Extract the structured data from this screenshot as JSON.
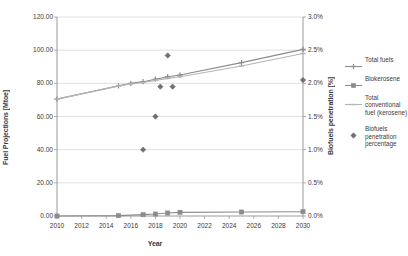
{
  "chart_data": {
    "type": "line",
    "title": "",
    "xlabel": "Year",
    "ylabel": "Fuel Projections [Mtoe]",
    "y2label": "Biofuels penetration [%]",
    "xlim": [
      2010,
      2030
    ],
    "ylim": [
      0,
      120
    ],
    "y2lim": [
      0,
      3
    ],
    "grid": true,
    "legend_position": "right",
    "xticks": [
      "2010",
      "2012",
      "2014",
      "2016",
      "2018",
      "2020",
      "2022",
      "2024",
      "2026",
      "2028",
      "2030"
    ],
    "yticks": [
      "0.00",
      "20.00",
      "40.00",
      "60.00",
      "80.00",
      "100.00",
      "120.00"
    ],
    "y2ticks": [
      "0.0%",
      "0.5%",
      "1.0%",
      "1.5%",
      "2.0%",
      "2.5%",
      "3.0%"
    ],
    "series": [
      {
        "name": "Total fuels",
        "axis": "left",
        "color": "#8c8c8c",
        "marker": "cross",
        "x": [
          2010,
          2015,
          2016,
          2017,
          2018,
          2019,
          2020,
          2025,
          2030
        ],
        "values": [
          70.5,
          78.5,
          80.0,
          81.0,
          82.5,
          84.0,
          85.0,
          92.5,
          100.5
        ]
      },
      {
        "name": "Total conventional fuel (kerosene)",
        "axis": "left",
        "color": "#b4b4b4",
        "marker": "dash",
        "x": [
          2010,
          2015,
          2016,
          2017,
          2018,
          2019,
          2020,
          2025,
          2030
        ],
        "values": [
          70.5,
          78.3,
          79.6,
          80.5,
          81.8,
          83.0,
          84.0,
          90.5,
          98.0
        ]
      },
      {
        "name": "Biokerosene",
        "axis": "left",
        "color": "#8c8c8c",
        "marker": "square",
        "x": [
          2010,
          2015,
          2017,
          2018,
          2019,
          2020,
          2025,
          2030
        ],
        "values": [
          0.0,
          0.2,
          0.8,
          1.2,
          1.8,
          2.2,
          2.4,
          2.6
        ]
      },
      {
        "name": "Biofuels penetration percentage",
        "axis": "right",
        "color": "#707070",
        "marker": "diamond",
        "type": "scatter",
        "x": [
          2017,
          2018,
          2018.4,
          2019,
          2019.4,
          2030
        ],
        "values": [
          1.0,
          1.5,
          1.95,
          2.42,
          1.95,
          2.05
        ]
      }
    ]
  },
  "legend": {
    "items": [
      {
        "label": "Total fuels",
        "key": "line-cross"
      },
      {
        "label": "Biokerosene",
        "key": "line-square"
      },
      {
        "label": "Total\nconventional\nfuel (kerosene)",
        "key": "line-dash"
      },
      {
        "label": "Biofuels\npenetration\npercentage",
        "key": "scatter-diamond"
      }
    ]
  },
  "colors": {
    "axis": "#9a9a9a",
    "grid": "#d8d8d8",
    "text": "#3a3a3a",
    "series_total_fuels": "#8c8c8c",
    "series_conventional": "#b4b4b4",
    "series_biokerosene": "#8c8c8c",
    "series_scatter": "#707070"
  }
}
